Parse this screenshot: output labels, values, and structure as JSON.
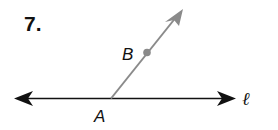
{
  "problem": {
    "number": "7."
  },
  "figure": {
    "line": {
      "label": "ℓ",
      "color": "#111111"
    },
    "ray": {
      "color": "#8a8a8a"
    },
    "points": [
      {
        "label": "A"
      },
      {
        "label": "B"
      }
    ]
  }
}
